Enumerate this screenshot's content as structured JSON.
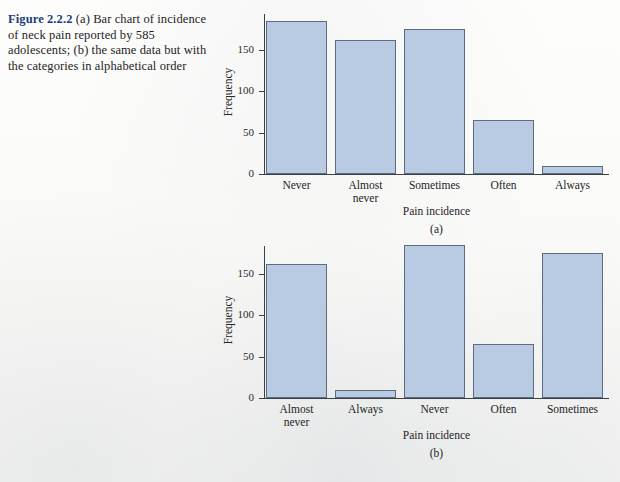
{
  "figure": {
    "label": "Figure 2.2.2",
    "caption": " (a) Bar chart of incidence of neck pain reported by 585 adolescents; (b) the same data but with the categories in alphabetical order",
    "accent_color": "#1c3f7a",
    "bar_fill_color": "#b8cbe3",
    "bar_border_color": "#5c6b7d",
    "page_background": "#fbfbf9"
  },
  "chart_data": [
    {
      "type": "bar",
      "panel": "(a)",
      "title": "",
      "categories": [
        "Never",
        "Almost\nnever",
        "Sometimes",
        "Often",
        "Always"
      ],
      "values": [
        185,
        162,
        175,
        65,
        10
      ],
      "xlabel": "Pain incidence",
      "ylabel": "Frequency",
      "ylim": [
        0,
        200
      ],
      "yticks": [
        0,
        50,
        100,
        150
      ],
      "ytick_labels": [
        "0",
        "50",
        "100",
        "150"
      ],
      "grid": false,
      "legend": false
    },
    {
      "type": "bar",
      "panel": "(b)",
      "title": "",
      "categories": [
        "Almost\nnever",
        "Always",
        "Never",
        "Often",
        "Sometimes"
      ],
      "values": [
        162,
        10,
        185,
        65,
        175
      ],
      "xlabel": "Pain incidence",
      "ylabel": "Frequency",
      "ylim": [
        0,
        200
      ],
      "yticks": [
        0,
        50,
        100,
        150
      ],
      "ytick_labels": [
        "0",
        "50",
        "100",
        "150"
      ],
      "grid": false,
      "legend": false
    }
  ]
}
